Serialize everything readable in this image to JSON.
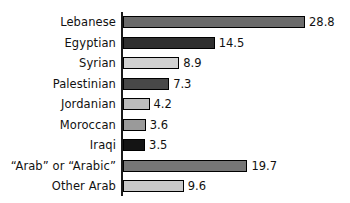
{
  "chart_data": {
    "type": "bar",
    "orientation": "horizontal",
    "title": "",
    "subtitle": "",
    "xlabel": "",
    "ylabel": "",
    "grid": false,
    "legend": false,
    "axis_visible": {
      "category_axis": true,
      "value_axis": false
    },
    "value_axis_ticks": [],
    "xlim": [
      0,
      28.8
    ],
    "value_labels_shown": true,
    "categories": [
      "Lebanese",
      "Egyptian",
      "Syrian",
      "Palestinian",
      "Jordanian",
      "Moroccan",
      "Iraqi",
      "“Arab” or “Arabic”",
      "Other Arab"
    ],
    "values": [
      28.8,
      14.5,
      8.9,
      7.3,
      4.2,
      3.6,
      3.5,
      19.7,
      9.6
    ],
    "value_text": [
      "28.8",
      "14.5",
      "8.9",
      "7.3",
      "4.2",
      "3.6",
      "3.5",
      "19.7",
      "9.6"
    ],
    "bar_colors": [
      "#6b6b6b",
      "#2f2f2f",
      "#d2d2d2",
      "#484848",
      "#bcbcbc",
      "#9a9a9a",
      "#141414",
      "#767676",
      "#c9c9c9"
    ],
    "bar_border_color": "#000000",
    "axis_color": "#1a1a1a",
    "text_color": "#111111",
    "background": "#ffffff"
  }
}
